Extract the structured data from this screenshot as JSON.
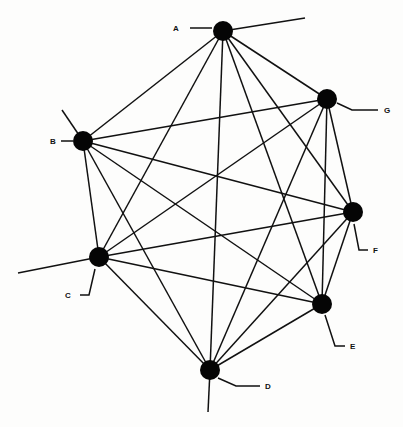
{
  "diagram": {
    "type": "complete-graph",
    "nodes": [
      {
        "id": "A",
        "label": "A"
      },
      {
        "id": "B",
        "label": "B"
      },
      {
        "id": "C",
        "label": "C"
      },
      {
        "id": "D",
        "label": "D"
      },
      {
        "id": "E",
        "label": "E"
      },
      {
        "id": "F",
        "label": "F"
      },
      {
        "id": "G",
        "label": "G"
      }
    ],
    "edges": [
      [
        "A",
        "B"
      ],
      [
        "A",
        "C"
      ],
      [
        "A",
        "D"
      ],
      [
        "A",
        "E"
      ],
      [
        "A",
        "F"
      ],
      [
        "A",
        "G"
      ],
      [
        "B",
        "C"
      ],
      [
        "B",
        "D"
      ],
      [
        "B",
        "E"
      ],
      [
        "B",
        "F"
      ],
      [
        "B",
        "G"
      ],
      [
        "C",
        "D"
      ],
      [
        "C",
        "E"
      ],
      [
        "C",
        "F"
      ],
      [
        "C",
        "G"
      ],
      [
        "D",
        "E"
      ],
      [
        "D",
        "F"
      ],
      [
        "D",
        "G"
      ],
      [
        "E",
        "F"
      ],
      [
        "E",
        "G"
      ],
      [
        "F",
        "G"
      ]
    ],
    "dangling_edges": [
      "A",
      "B",
      "C",
      "D"
    ],
    "colors": {
      "line": "#111111",
      "node": "#050505",
      "background": "#fdfdfc"
    }
  }
}
